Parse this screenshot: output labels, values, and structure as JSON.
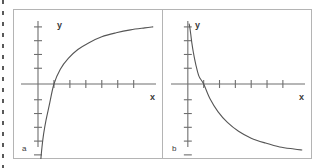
{
  "figure": {
    "background_color": "#ffffff",
    "frame_color": "#b4b4b4",
    "axis_color": "#6e6e6e",
    "curve_color": "#555555",
    "margin_rule": "dashed-margin-rule"
  },
  "panels": [
    {
      "id": "a",
      "caption": "a",
      "x_axis_label": "x",
      "y_axis_label": "y"
    },
    {
      "id": "b",
      "caption": "b",
      "x_axis_label": "x",
      "y_axis_label": "y"
    }
  ],
  "chart_data": [
    {
      "type": "line",
      "panel": "a",
      "title": "a",
      "xlabel": "x",
      "ylabel": "y",
      "grid": false,
      "legend": null,
      "axis_style": "bare-axes-with-ticks",
      "xlim": [
        -0.6,
        7.4
      ],
      "ylim": [
        -5.6,
        3.2
      ],
      "x_ticks": [
        1,
        2,
        3,
        4,
        5,
        6
      ],
      "y_ticks": [
        -5,
        -4.3,
        -3.6,
        -2.9,
        -2.2,
        -1.5,
        -0.8,
        0.8,
        1.5,
        2.2,
        2.9
      ],
      "description": "increasing logarithm-like curve rising steeply from below, crossing the x-axis near x = 1 and flattening toward the right",
      "x": [
        0.08,
        0.12,
        0.18,
        0.25,
        0.35,
        0.5,
        0.7,
        1.0,
        1.4,
        1.9,
        2.5,
        3.2,
        4.0,
        4.9,
        5.8,
        6.7,
        7.2
      ],
      "y": [
        -5.05,
        -4.4,
        -3.8,
        -3.2,
        -2.55,
        -1.85,
        -1.1,
        0.0,
        0.75,
        1.3,
        1.75,
        2.1,
        2.4,
        2.6,
        2.75,
        2.85,
        2.9
      ]
    },
    {
      "type": "line",
      "panel": "b",
      "title": "b",
      "xlabel": "x",
      "ylabel": "y",
      "grid": false,
      "legend": null,
      "axis_style": "bare-axes-with-ticks",
      "xlim": [
        -0.6,
        7.4
      ],
      "ylim": [
        -5.6,
        3.2
      ],
      "x_ticks": [
        1,
        2,
        3,
        4,
        5,
        6
      ],
      "y_ticks": [
        -5,
        -4.3,
        -3.6,
        -2.9,
        -2.2,
        -1.5,
        -0.8,
        0.8,
        1.5,
        2.2,
        2.9
      ],
      "description": "decreasing reciprocal-like curve falling steeply from high values near the y-axis, crossing the x-axis near x = 1 and approaching a horizontal asymptote on the right",
      "x": [
        0.08,
        0.12,
        0.18,
        0.25,
        0.35,
        0.5,
        0.7,
        1.0,
        1.4,
        1.9,
        2.5,
        3.2,
        4.0,
        4.9,
        5.8,
        6.7,
        7.2
      ],
      "y": [
        3.05,
        2.9,
        2.55,
        2.1,
        1.6,
        1.0,
        0.4,
        0.0,
        -0.75,
        -1.4,
        -1.95,
        -2.4,
        -2.75,
        -3.0,
        -3.2,
        -3.3,
        -3.35
      ]
    }
  ]
}
